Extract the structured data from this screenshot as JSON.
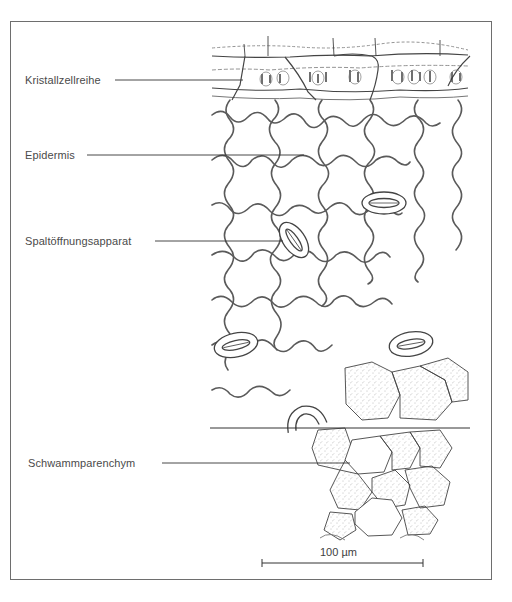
{
  "figure": {
    "labels": [
      {
        "id": "kristallzellreihe",
        "text": "Kristallzellreihe"
      },
      {
        "id": "epidermis",
        "text": "Epidermis"
      },
      {
        "id": "spaltoeffnungsapparat",
        "text": "Spaltöffnungsapparat"
      },
      {
        "id": "schwammparenchym",
        "text": "Schwammparenchym"
      }
    ],
    "scale_bar": {
      "text": "100 µm"
    },
    "colors": {
      "frame": "#6e6e6e",
      "line": "#3a3a3a",
      "cell_wall": "#555555",
      "text": "#4a4a4a"
    }
  }
}
